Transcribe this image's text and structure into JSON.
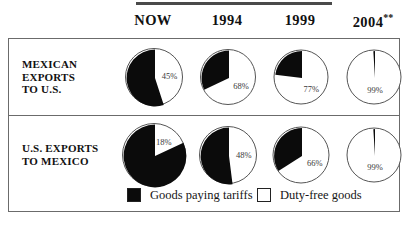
{
  "header": {
    "columns": [
      {
        "label": "NOW",
        "note": ""
      },
      {
        "label": "1994",
        "note": ""
      },
      {
        "label": "1999",
        "note": ""
      },
      {
        "label": "2004",
        "note": "**"
      }
    ]
  },
  "rows": [
    {
      "label_lines": [
        "MEXICAN",
        "EXPORTS",
        "TO U.S."
      ],
      "cells": [
        {
          "duty_free_label": "45%",
          "duty_free_pct": 45,
          "tariff_pct": 55,
          "size": 58
        },
        {
          "duty_free_label": "68%",
          "duty_free_pct": 68,
          "tariff_pct": 32,
          "size": 56
        },
        {
          "duty_free_label": "77%",
          "duty_free_pct": 77,
          "tariff_pct": 23,
          "size": 55
        },
        {
          "duty_free_label": "99%",
          "duty_free_pct": 99,
          "tariff_pct": 1,
          "size": 55
        }
      ]
    },
    {
      "label_lines": [
        "U.S. EXPORTS",
        "TO MEXICO"
      ],
      "cells": [
        {
          "duty_free_label": "18%",
          "duty_free_pct": 18,
          "tariff_pct": 82,
          "size": 64
        },
        {
          "duty_free_label": "48%",
          "duty_free_pct": 48,
          "tariff_pct": 52,
          "size": 58
        },
        {
          "duty_free_label": "66%",
          "duty_free_pct": 66,
          "tariff_pct": 34,
          "size": 57
        },
        {
          "duty_free_label": "99%",
          "duty_free_pct": 99,
          "tariff_pct": 1,
          "size": 55
        }
      ]
    }
  ],
  "legend": [
    {
      "key": "tariff",
      "swatch": "filled",
      "label": "Goods paying tariffs"
    },
    {
      "key": "duty-free",
      "swatch": "empty",
      "label": "Duty-free goods"
    }
  ],
  "colors": {
    "tariff": "#0b0b0b",
    "duty_free": "#ffffff",
    "border": "#6b6b6b",
    "text": "#111111"
  },
  "chart_data": {
    "type": "pie",
    "title": "",
    "series_names": [
      "Goods paying tariffs",
      "Duty-free goods"
    ],
    "categories": [
      "NOW",
      "1994",
      "1999",
      "2004**"
    ],
    "groups": [
      {
        "name": "MEXICAN EXPORTS TO U.S.",
        "duty_free": [
          45,
          68,
          77,
          99
        ],
        "goods_paying_tariffs": [
          55,
          32,
          23,
          1
        ],
        "labels": [
          "45%",
          "68%",
          "77%",
          "99%"
        ]
      },
      {
        "name": "U.S. EXPORTS TO MEXICO",
        "duty_free": [
          18,
          48,
          66,
          99
        ],
        "goods_paying_tariffs": [
          82,
          52,
          34,
          1
        ],
        "labels": [
          "18%",
          "48%",
          "66%",
          "99%"
        ]
      }
    ],
    "legend": [
      "Goods paying tariffs",
      "Duty-free goods"
    ],
    "legend_position": "bottom",
    "units": "percent",
    "notes": "**"
  }
}
